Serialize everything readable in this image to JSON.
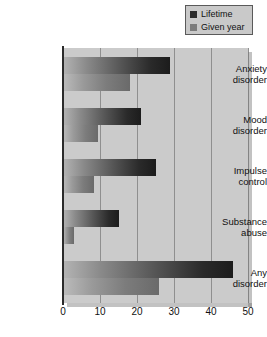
{
  "chart_data": {
    "type": "bar",
    "orientation": "horizontal",
    "title": "",
    "xlabel": "",
    "ylabel": "",
    "xlim": [
      0,
      50
    ],
    "xticks": [
      0,
      10,
      20,
      30,
      40,
      50
    ],
    "grid": true,
    "legend_position": "top-right",
    "categories": [
      "Anxiety disorder",
      "Mood disorder",
      "Impulse control",
      "Substance abuse",
      "Any disorder"
    ],
    "series": [
      {
        "name": "Lifetime",
        "color": "#2a2a2a",
        "values": [
          29,
          21,
          25,
          15,
          46
        ]
      },
      {
        "name": "Given year",
        "color": "#7c7c7c",
        "values": [
          18,
          9.5,
          8.5,
          3,
          26
        ]
      }
    ]
  },
  "legend": {
    "items": [
      {
        "label": "Lifetime",
        "swatch": "#2a2a2a"
      },
      {
        "label": "Given year",
        "swatch": "#7c7c7c"
      }
    ]
  },
  "axis": {
    "ticks": [
      "0",
      "10",
      "20",
      "30",
      "40",
      "50"
    ]
  },
  "categories": [
    {
      "line1": "Anxiety",
      "line2": "disorder"
    },
    {
      "line1": "Mood",
      "line2": "disorder"
    },
    {
      "line1": "Impulse",
      "line2": "control"
    },
    {
      "line1": "Substance",
      "line2": "abuse"
    },
    {
      "line1": "Any",
      "line2": "disorder"
    }
  ],
  "colors": {
    "plot_background": "#cbcbcb",
    "gridline": "#8f8f8f",
    "axis": "#2b2b2b",
    "legend_background": "#c9c9c9",
    "text": "#111111"
  }
}
